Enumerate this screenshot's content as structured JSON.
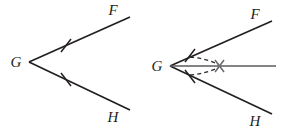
{
  "figure": {
    "canvas": {
      "width": 284,
      "height": 129,
      "background": "#ffffff"
    },
    "colors": {
      "ink": "#231f20",
      "gray_ray": "#5b5b5f",
      "dashed": "#2b2b2e",
      "cross": "#6a6a6e",
      "background": "#ffffff"
    },
    "panels": [
      {
        "id": "left-panel",
        "name": "original-angle",
        "vertex": {
          "label": "G",
          "x": 29,
          "y": 62,
          "label_x": 16,
          "label_y": 67
        },
        "rays": [
          {
            "id": "ray-gf",
            "label": "F",
            "from": [
              29,
              62
            ],
            "to": [
              130,
              17
            ],
            "label_x": 113,
            "label_y": 15
          },
          {
            "id": "ray-gh",
            "label": "H",
            "from": [
              29,
              62
            ],
            "to": [
              130,
              110
            ],
            "label_x": 113,
            "label_y": 122
          }
        ],
        "tick_marks": [
          {
            "id": "tick-gf",
            "x": 66,
            "y": 45.5
          },
          {
            "id": "tick-gh",
            "x": 66,
            "y": 79.5
          }
        ]
      },
      {
        "id": "right-panel",
        "name": "bisected-angle",
        "vertex": {
          "label": "G",
          "x": 170,
          "y": 66,
          "label_x": 157,
          "label_y": 71
        },
        "rays": [
          {
            "id": "ray-gf-2",
            "label": "F",
            "from": [
              170,
              66
            ],
            "to": [
              272,
              21
            ],
            "label_x": 255,
            "label_y": 19
          },
          {
            "id": "ray-gh-2",
            "label": "H",
            "from": [
              170,
              66
            ],
            "to": [
              272,
              114
            ],
            "label_x": 255,
            "label_y": 126
          },
          {
            "id": "ray-bisector",
            "label": "",
            "from": [
              170,
              66
            ],
            "to": [
              276,
              66
            ],
            "label_x": 0,
            "label_y": 0
          }
        ],
        "tick_marks": [
          {
            "id": "tick-gf-2",
            "x": 190,
            "y": 57
          },
          {
            "id": "tick-gh-2",
            "x": 190,
            "y": 75
          }
        ],
        "dashed_arcs": [
          {
            "id": "arc-from-f-tick",
            "from": [
              190,
              57
            ],
            "to": [
              220,
              66
            ]
          },
          {
            "id": "arc-from-h-tick",
            "from": [
              190,
              75
            ],
            "to": [
              220,
              66
            ]
          }
        ],
        "cross_mark": {
          "id": "intersection-cross",
          "x": 220,
          "y": 66,
          "size": 7
        }
      }
    ]
  }
}
